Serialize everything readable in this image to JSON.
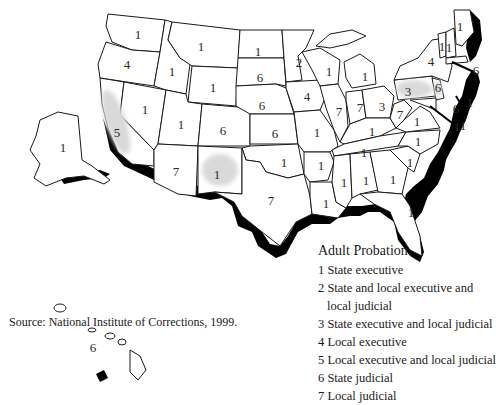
{
  "map": {
    "title": "Adult Probation",
    "state_labels": [
      {
        "state": "Washington",
        "value": "1",
        "x": 138,
        "y": 35
      },
      {
        "state": "Oregon",
        "value": "4",
        "x": 127,
        "y": 65
      },
      {
        "state": "California",
        "value": "5",
        "x": 117,
        "y": 133
      },
      {
        "state": "Nevada",
        "value": "1",
        "x": 145,
        "y": 110
      },
      {
        "state": "Idaho",
        "value": "1",
        "x": 172,
        "y": 72
      },
      {
        "state": "Montana",
        "value": "1",
        "x": 201,
        "y": 47
      },
      {
        "state": "Wyoming",
        "value": "1",
        "x": 213,
        "y": 88
      },
      {
        "state": "Utah",
        "value": "1",
        "x": 181,
        "y": 125
      },
      {
        "state": "Colorado",
        "value": "6",
        "x": 223,
        "y": 131
      },
      {
        "state": "Arizona",
        "value": "7",
        "x": 176,
        "y": 172
      },
      {
        "state": "New Mexico",
        "value": "1",
        "x": 217,
        "y": 175
      },
      {
        "state": "North Dakota",
        "value": "1",
        "x": 258,
        "y": 52
      },
      {
        "state": "South Dakota",
        "value": "6",
        "x": 260,
        "y": 78
      },
      {
        "state": "Nebraska",
        "value": "6",
        "x": 262,
        "y": 106
      },
      {
        "state": "Kansas",
        "value": "6",
        "x": 275,
        "y": 134
      },
      {
        "state": "Oklahoma",
        "value": "1",
        "x": 284,
        "y": 163
      },
      {
        "state": "Texas",
        "value": "7",
        "x": 271,
        "y": 201
      },
      {
        "state": "Minnesota",
        "value": "2",
        "x": 299,
        "y": 63
      },
      {
        "state": "Iowa",
        "value": "4",
        "x": 307,
        "y": 97
      },
      {
        "state": "Missouri",
        "value": "1",
        "x": 317,
        "y": 133
      },
      {
        "state": "Arkansas",
        "value": "1",
        "x": 321,
        "y": 166
      },
      {
        "state": "Louisiana",
        "value": "1",
        "x": 326,
        "y": 204
      },
      {
        "state": "Wisconsin",
        "value": "1",
        "x": 329,
        "y": 72
      },
      {
        "state": "Illinois",
        "value": "7",
        "x": 339,
        "y": 112
      },
      {
        "state": "Michigan",
        "value": "1",
        "x": 365,
        "y": 77
      },
      {
        "state": "Indiana",
        "value": "7",
        "x": 360,
        "y": 108
      },
      {
        "state": "Ohio",
        "value": "3",
        "x": 382,
        "y": 107
      },
      {
        "state": "Kentucky",
        "value": "1",
        "x": 372,
        "y": 132
      },
      {
        "state": "Tennessee",
        "value": "1",
        "x": 364,
        "y": 153
      },
      {
        "state": "Mississippi",
        "value": "1",
        "x": 344,
        "y": 183
      },
      {
        "state": "Alabama",
        "value": "1",
        "x": 366,
        "y": 181
      },
      {
        "state": "Georgia",
        "value": "1",
        "x": 393,
        "y": 180
      },
      {
        "state": "Florida",
        "value": "1",
        "x": 411,
        "y": 213
      },
      {
        "state": "South Carolina",
        "value": "1",
        "x": 410,
        "y": 163
      },
      {
        "state": "North Carolina",
        "value": "1",
        "x": 418,
        "y": 142
      },
      {
        "state": "West Virginia",
        "value": "7",
        "x": 400,
        "y": 115
      },
      {
        "state": "Virginia",
        "value": "1",
        "x": 417,
        "y": 122
      },
      {
        "state": "Pennsylvania",
        "value": "3",
        "x": 408,
        "y": 92
      },
      {
        "state": "New York",
        "value": "4",
        "x": 431,
        "y": 62
      },
      {
        "state": "Vermont",
        "value": "1",
        "x": 442,
        "y": 47
      },
      {
        "state": "New Hampshire",
        "value": "1",
        "x": 449,
        "y": 48
      },
      {
        "state": "Maine",
        "value": "1",
        "x": 460,
        "y": 27
      },
      {
        "state": "Massachusetts",
        "value": "6",
        "x": 476,
        "y": 71
      },
      {
        "state": "Rhode Island",
        "value": "1",
        "x": 470,
        "y": 103
      },
      {
        "state": "Connecticut",
        "value": "6",
        "x": 456,
        "y": 109
      },
      {
        "state": "New Jersey",
        "value": "6",
        "x": 438,
        "y": 88
      },
      {
        "state": "Delaware",
        "value": "1",
        "x": 457,
        "y": 127
      },
      {
        "state": "Maryland",
        "value": "1",
        "x": 463,
        "y": 126
      },
      {
        "state": "Alaska",
        "value": "1",
        "x": 63,
        "y": 148
      },
      {
        "state": "Hawaii",
        "value": "6",
        "x": 93,
        "y": 348
      }
    ],
    "shaded_states": [
      "California",
      "New Mexico",
      "Pennsylvania",
      "New Jersey"
    ],
    "colors": {
      "shade": "#d9d9d9",
      "coast": "#000000",
      "outline": "#1a1a1a"
    }
  },
  "legend": {
    "title": "Adult Probation",
    "items": [
      {
        "code": "1",
        "label": "State executive"
      },
      {
        "code": "2",
        "label": "State and local executive and",
        "continuation": "local judicial"
      },
      {
        "code": "3",
        "label": "State executive and local judicial"
      },
      {
        "code": "4",
        "label": "Local executive"
      },
      {
        "code": "5",
        "label": "Local executive and local judicial"
      },
      {
        "code": "6",
        "label": "State judicial"
      },
      {
        "code": "7",
        "label": "Local judicial"
      }
    ]
  },
  "source": "Source: National Institute of Corrections, 1999."
}
